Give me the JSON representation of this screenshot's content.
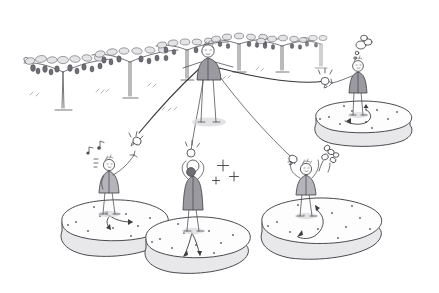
{
  "illustration": {
    "title": "Vineyard distribution sketch",
    "style": "hand-drawn pen and grey wash line illustration",
    "background_color": "#ffffff",
    "ink_color": "#3d3d42",
    "fill_grey": "#9a9aa0",
    "island_top_color": "#fdfdfd",
    "island_side_color": "#e8e8ea",
    "width": 439,
    "height": 293
  },
  "scene": {
    "setting_label": "vineyard with pergola-trained grape vines",
    "ground_label": "open ground",
    "figure_count": 5,
    "island_count": 4,
    "cord_count": 3
  },
  "vines": {
    "label": "grape arbor row",
    "count": 6,
    "items": [
      {
        "name": "vine-1",
        "x": 63,
        "y": 72,
        "scale": 1.0
      },
      {
        "name": "vine-2",
        "x": 118,
        "y": 62,
        "scale": 0.92
      },
      {
        "name": "vine-3",
        "x": 150,
        "y": 55,
        "scale": 0.8
      },
      {
        "name": "vine-4",
        "x": 196,
        "y": 48,
        "scale": 0.78
      },
      {
        "name": "vine-5",
        "x": 238,
        "y": 45,
        "scale": 0.74
      },
      {
        "name": "vine-6",
        "x": 272,
        "y": 50,
        "scale": 0.72
      }
    ]
  },
  "figures": [
    {
      "name": "central-giver",
      "role": "giver",
      "position_label": "center, on open ground",
      "x": 208,
      "y": 48,
      "holds": "three cords",
      "on_island": false,
      "reaction": "none"
    },
    {
      "name": "receiver-upper-right",
      "role": "receiver",
      "position_label": "upper right island",
      "x": 357,
      "y": 62,
      "holds": "bell handle",
      "on_island": true,
      "reaction": "thought-cloud"
    },
    {
      "name": "receiver-left",
      "role": "receiver",
      "position_label": "lower left island",
      "x": 108,
      "y": 165,
      "holds": "reaching upward",
      "on_island": true,
      "reaction": "music-notes"
    },
    {
      "name": "receiver-center",
      "role": "receiver",
      "position_label": "lower center island",
      "x": 192,
      "y": 172,
      "holds": "ball with both hands",
      "on_island": true,
      "reaction": "sparkles"
    },
    {
      "name": "receiver-right",
      "role": "receiver",
      "position_label": "lower right island",
      "x": 305,
      "y": 175,
      "holds": "bell handle",
      "on_island": true,
      "reaction": "flower-burst"
    }
  ],
  "islands": [
    {
      "name": "island-upper-right",
      "cx": 363,
      "cy": 128,
      "rx": 48,
      "ry": 19,
      "speck_count": 10,
      "has_arrow_path": true
    },
    {
      "name": "island-left",
      "cx": 117,
      "cy": 232,
      "rx": 54,
      "ry": 22,
      "speck_count": 11,
      "has_arrow_path": true
    },
    {
      "name": "island-center",
      "cx": 197,
      "cy": 248,
      "rx": 52,
      "ry": 22,
      "speck_count": 10,
      "has_arrow_path": true
    },
    {
      "name": "island-right",
      "cx": 322,
      "cy": 232,
      "rx": 60,
      "ry": 24,
      "speck_count": 12,
      "has_arrow_path": true
    }
  ],
  "cords": [
    {
      "name": "cord-to-upper-right",
      "from": "central-giver",
      "to": "receiver-upper-right",
      "end_object": "bell"
    },
    {
      "name": "cord-to-left",
      "from": "central-giver",
      "to": "receiver-left",
      "end_object": "bell"
    },
    {
      "name": "cord-to-center",
      "from": "central-giver",
      "to": "receiver-center",
      "end_object": "ball"
    },
    {
      "name": "cord-to-right",
      "from": "central-giver",
      "to": "receiver-right",
      "end_object": "bell"
    }
  ],
  "reaction_marks": [
    {
      "name": "music-notes",
      "near": "receiver-left",
      "x": 88,
      "y": 152
    },
    {
      "name": "sparkle-stars",
      "near": "receiver-center",
      "x": 223,
      "y": 168
    },
    {
      "name": "flower-burst",
      "near": "receiver-right",
      "x": 325,
      "y": 157
    },
    {
      "name": "thought-cloud",
      "near": "receiver-upper-right",
      "x": 361,
      "y": 45
    },
    {
      "name": "impact-lines-left",
      "near": "cord-to-left",
      "x": 133,
      "y": 132
    },
    {
      "name": "impact-lines-center",
      "near": "cord-to-center",
      "x": 188,
      "y": 148
    },
    {
      "name": "impact-lines-right",
      "near": "cord-to-upper-right",
      "x": 322,
      "y": 75
    }
  ]
}
